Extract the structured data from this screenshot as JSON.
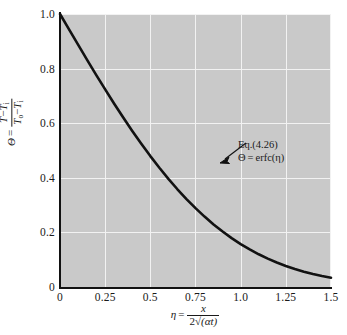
{
  "chart_data": {
    "type": "line",
    "title": "",
    "xlabel": "η = x / (2√(αt))",
    "ylabel": "Θ = (T − T_i) / (T_o − T_i)",
    "xlim": [
      0,
      1.5
    ],
    "ylim": [
      0,
      1.0
    ],
    "xticks": [
      "0",
      "0.25",
      "0.5",
      "0.75",
      "1.0",
      "1.25",
      "1.5"
    ],
    "xtick_values": [
      0,
      0.25,
      0.5,
      0.75,
      1.0,
      1.25,
      1.5
    ],
    "yticks": [
      "0",
      "0.2",
      "0.4",
      "0.6",
      "0.8",
      "1.0"
    ],
    "ytick_values": [
      0,
      0.2,
      0.4,
      0.6,
      0.8,
      1.0
    ],
    "grid": true,
    "grid_color": "#f2f2f2",
    "plot_background": "#c9c9c9",
    "page_background": "#ffffff",
    "curve_color": "#111111",
    "legend": "none",
    "series": [
      {
        "name": "Θ = erfc(η)",
        "x": [
          0,
          0.05,
          0.1,
          0.15,
          0.2,
          0.25,
          0.3,
          0.35,
          0.4,
          0.45,
          0.5,
          0.55,
          0.6,
          0.65,
          0.7,
          0.75,
          0.8,
          0.85,
          0.9,
          0.95,
          1.0,
          1.05,
          1.1,
          1.15,
          1.2,
          1.25,
          1.3,
          1.35,
          1.4,
          1.45,
          1.5
        ],
        "values": [
          1.0,
          0.9436,
          0.8875,
          0.832,
          0.7773,
          0.7237,
          0.6714,
          0.6206,
          0.5716,
          0.5245,
          0.4795,
          0.4367,
          0.3961,
          0.358,
          0.3222,
          0.2888,
          0.2579,
          0.2293,
          0.2031,
          0.1791,
          0.1573,
          0.1376,
          0.1198,
          0.1039,
          0.0897,
          0.0771,
          0.066,
          0.0562,
          0.0477,
          0.0403,
          0.0339
        ]
      }
    ],
    "annotations": [
      {
        "name": "equation-callout",
        "line1": "Eq.(4.26)",
        "line2_theta": "Θ",
        "line2_equals": "=",
        "line2_expr": "erfc(η)",
        "points_to_x": 0.47,
        "points_to_y": 0.5
      }
    ]
  },
  "axes": {
    "y_title": {
      "theta": "Θ",
      "equals": "=",
      "num_t": "T",
      "num_minus": "−",
      "num_ti": "T",
      "num_ti_sub": "i",
      "den_to": "T",
      "den_to_sub": "o",
      "den_minus": "−",
      "den_ti": "T",
      "den_ti_sub": "i"
    },
    "x_title": {
      "eta": "η",
      "equals": "=",
      "num": "x",
      "den_two": "2",
      "den_radical": "√",
      "den_inner": "(αt)"
    }
  }
}
